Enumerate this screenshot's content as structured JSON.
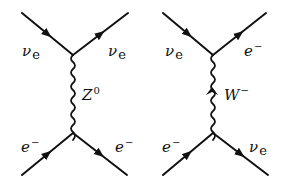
{
  "diagrams": [
    {
      "name": "Z0 exchange (neutral current)",
      "labels": {
        "top_left": {
          "base": "ν",
          "sub": "e",
          "sup": ""
        },
        "top_right": {
          "base": "ν",
          "sub": "e",
          "sup": ""
        },
        "bottom_left": {
          "base": "e",
          "sub": "",
          "sup": "−"
        },
        "bottom_right": {
          "base": "e",
          "sub": "",
          "sup": "−"
        },
        "boson": {
          "base": "Z",
          "sub": "",
          "sup": "0"
        }
      }
    },
    {
      "name": "W- exchange (charged current)",
      "labels": {
        "top_left": {
          "base": "ν",
          "sub": "e",
          "sup": ""
        },
        "top_right": {
          "base": "e",
          "sub": "",
          "sup": "−"
        },
        "bottom_left": {
          "base": "e",
          "sub": "",
          "sup": "−"
        },
        "bottom_right": {
          "base": "ν",
          "sub": "e",
          "sup": ""
        },
        "boson": {
          "base": "W",
          "sub": "",
          "sup": "−"
        }
      }
    }
  ],
  "colors": {
    "line": "#111111",
    "background": "#ffffff"
  }
}
